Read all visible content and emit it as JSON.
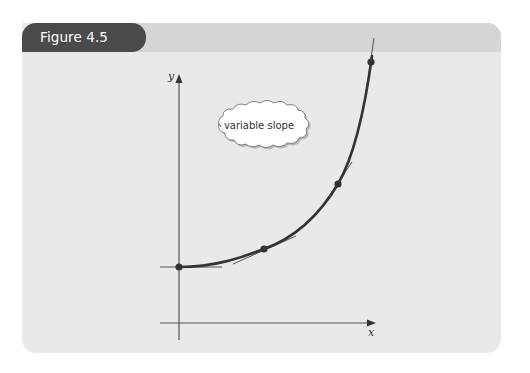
{
  "figure": {
    "label": "Figure 4.5"
  },
  "diagram": {
    "y_axis_label": "y",
    "x_axis_label": "x",
    "callout_text": "variable slope",
    "colors": {
      "panel_bg": "#e9e9e9",
      "header_bar": "#d5d5d5",
      "tab_bg": "#4a4a4a",
      "curve": "#333333",
      "axis": "#555555"
    },
    "curve_description": "Convex increasing curve starting at the y-axis intercept with tangent lines drawn at four points showing increasing slope",
    "tangent_points": [
      {
        "x": 179,
        "y": 267
      },
      {
        "x": 264,
        "y": 249
      },
      {
        "x": 338,
        "y": 184
      },
      {
        "x": 371,
        "y": 62
      }
    ]
  }
}
